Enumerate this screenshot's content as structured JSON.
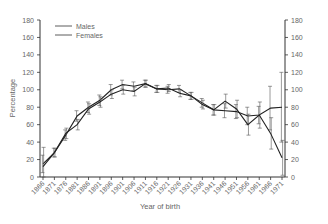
{
  "chart_data": {
    "type": "line",
    "title": "",
    "xlabel": "Year of birth",
    "ylabel": "Percentage",
    "ylim": [
      0,
      180
    ],
    "yticks": [
      0,
      20,
      40,
      60,
      80,
      100,
      120,
      140,
      160,
      180
    ],
    "dual_y_axis": true,
    "grid": false,
    "legend_position": "upper-left",
    "categories": [
      "1866",
      "1871",
      "1876",
      "1881",
      "1886",
      "1891",
      "1896",
      "1901",
      "1906",
      "1911",
      "1916",
      "1921",
      "1926",
      "1931",
      "1936",
      "1941",
      "1946",
      "1951",
      "1956",
      "1961",
      "1966",
      "1971"
    ],
    "series": [
      {
        "name": "Males",
        "values": [
          15,
          28,
          48,
          70,
          80,
          88,
          100,
          106,
          104,
          107,
          101,
          100,
          101,
          93,
          85,
          77,
          76,
          75,
          70,
          71,
          79,
          80
        ],
        "error": [
          10,
          5,
          6,
          6,
          6,
          6,
          6,
          5,
          5,
          4,
          4,
          4,
          4,
          4,
          5,
          6,
          8,
          8,
          10,
          10,
          25,
          40
        ]
      },
      {
        "name": "Females",
        "values": [
          12,
          28,
          50,
          60,
          78,
          86,
          95,
          100,
          98,
          107,
          101,
          102,
          96,
          93,
          83,
          77,
          87,
          78,
          60,
          71,
          50,
          22
        ],
        "error": [
          22,
          5,
          6,
          6,
          6,
          6,
          5,
          5,
          5,
          4,
          4,
          4,
          4,
          4,
          5,
          6,
          8,
          10,
          12,
          15,
          18,
          20
        ]
      }
    ]
  },
  "legend": {
    "items": [
      {
        "label": "Males"
      },
      {
        "label": "Females"
      }
    ]
  },
  "axes": {
    "xlabel": "Year of birth",
    "ylabel": "Percentage"
  }
}
